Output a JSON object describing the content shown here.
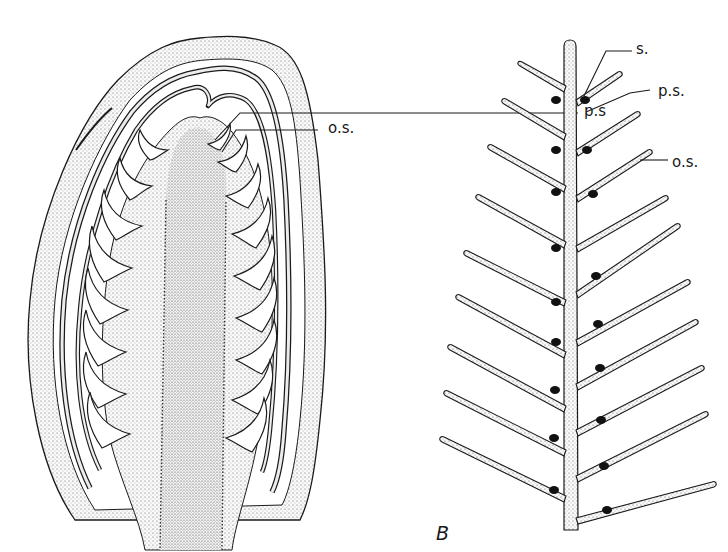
{
  "figure": {
    "panels": [
      {
        "id": "A",
        "description": "Longitudinal section of cone/strobilus with scales and ovules",
        "letter": "",
        "labels": [
          {
            "text": "p.s",
            "x": 584,
            "y": 104
          },
          {
            "text": "o.s.",
            "x": 528,
            "y": 121
          }
        ]
      },
      {
        "id": "B",
        "description": "Branched axis with paired scales and seeds",
        "letter": "B",
        "labels": [
          {
            "text": "s.",
            "x": 636,
            "y": 42
          },
          {
            "text": "p.s.",
            "x": 658,
            "y": 84
          },
          {
            "text": "o.s.",
            "x": 672,
            "y": 155
          }
        ]
      }
    ],
    "colors": {
      "ink": "#1a1a1a",
      "stipple": "#e7e7e7",
      "background": "#ffffff"
    }
  }
}
